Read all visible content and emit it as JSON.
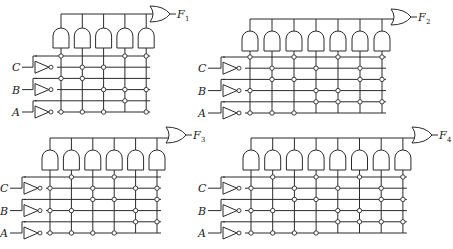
{
  "diagram": {
    "rows": [
      "C",
      "C'",
      "B",
      "B'",
      "A",
      "A'"
    ],
    "inputs": [
      "C",
      "B",
      "A"
    ],
    "circuits": [
      {
        "name": "F",
        "subscript": "1",
        "origin": [
          0,
          0
        ],
        "columns": 5,
        "connections": [
          [
            0,
            2,
            5
          ],
          [
            1,
            3,
            5
          ],
          [
            0,
            1,
            5
          ],
          [
            2,
            3,
            4
          ],
          [
            4,
            2,
            4
          ],
          [
            2,
            3,
            5
          ]
        ],
        "dots": {
          "C": [
            1,
            4,
            5
          ],
          "C'": [
            2,
            3
          ],
          "B": [
            1,
            2
          ],
          "B'": [
            3,
            4,
            5
          ],
          "A": [
            4
          ],
          "A'": [
            1,
            2,
            3,
            5
          ]
        }
      },
      {
        "name": "F",
        "subscript": "2",
        "columns": 7,
        "dots": {
          "C": [
            1,
            3,
            5,
            7
          ],
          "C'": [
            2,
            4,
            6
          ],
          "B": [
            2,
            3,
            6,
            7
          ],
          "B'": [
            1,
            4,
            5
          ],
          "A": [
            4,
            5,
            6,
            7
          ],
          "A'": [
            1,
            2,
            3
          ]
        }
      },
      {
        "name": "F",
        "subscript": "3",
        "columns": 6,
        "dots": {
          "C": [
            2,
            4
          ],
          "C'": [
            1,
            3,
            5,
            6
          ],
          "B": [
            3,
            4,
            6
          ],
          "B'": [
            1,
            2,
            5
          ],
          "A": [
            5,
            6
          ],
          "A'": [
            1,
            2,
            3,
            4
          ]
        }
      },
      {
        "name": "F",
        "subscript": "4",
        "columns": 8,
        "dots": {
          "C": [
            2,
            4,
            6,
            8
          ],
          "C'": [
            1,
            3,
            5,
            7
          ],
          "B": [
            3,
            4,
            7,
            8
          ],
          "B'": [
            1,
            2,
            5,
            6
          ],
          "A": [
            5,
            6,
            7,
            8
          ],
          "A'": [
            1,
            2,
            3,
            4
          ]
        }
      }
    ]
  }
}
